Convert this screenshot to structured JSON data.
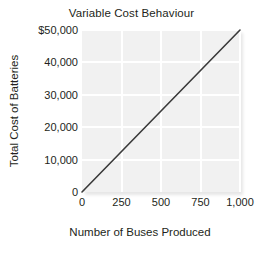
{
  "chart_data": {
    "type": "line",
    "title": "Variable Cost Behaviour",
    "xlabel": "Number of Buses Produced",
    "ylabel": "Total Cost of Batteries",
    "x": [
      0,
      1000
    ],
    "values": [
      0,
      50000
    ],
    "series": [
      {
        "name": "Total Cost of Batteries",
        "x": [
          0,
          1000
        ],
        "values": [
          0,
          50000
        ]
      }
    ],
    "xlim": [
      0,
      1000
    ],
    "ylim": [
      0,
      50000
    ],
    "xticks": [
      0,
      250,
      500,
      750,
      1000
    ],
    "yticks": [
      0,
      10000,
      20000,
      30000,
      40000,
      50000
    ],
    "xticklabels": [
      "0",
      "250",
      "500",
      "750",
      "1,000"
    ],
    "yticklabels": [
      "0",
      "10,000",
      "20,000",
      "30,000",
      "40,000",
      "$50,000"
    ],
    "grid": true,
    "legend": false,
    "line_color": "#3a3a3a",
    "plot_background": "#f1f1f1",
    "gridline_color": "#ffffff",
    "text_color": "#231f20"
  }
}
